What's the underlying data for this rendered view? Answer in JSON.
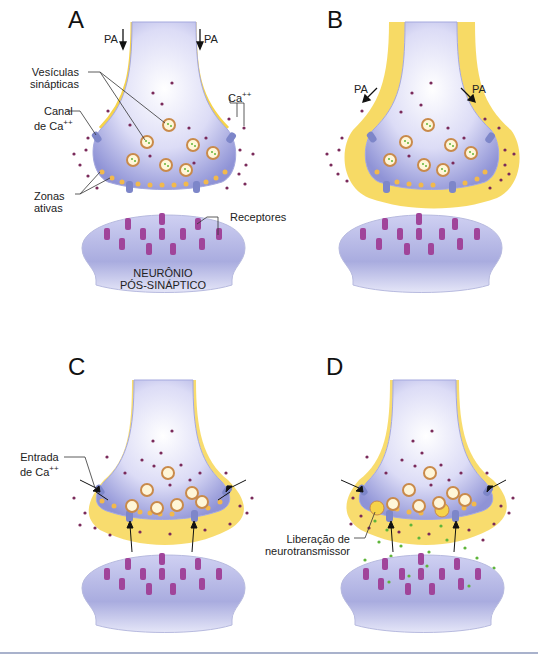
{
  "figure": {
    "panels": [
      {
        "id": "A",
        "letter": "A",
        "labels": {
          "pa_left": "PA",
          "pa_right": "PA",
          "vesicles": "Vesículas sinápticas",
          "vesicles_line1": "Vesículas",
          "vesicles_line2": "sinápticas",
          "ca_channel_line1": "Canal",
          "ca_channel_line2": "de Ca",
          "ca_channel_sup": "++",
          "ca_ion": "Ca",
          "ca_ion_sup": "++",
          "active_zones_line1": "Zonas",
          "active_zones_line2": "ativas",
          "receptors": "Receptores",
          "postsynaptic_line1": "NEURÔNIO",
          "postsynaptic_line2": "PÓS-SINÁPTICO"
        }
      },
      {
        "id": "B",
        "letter": "B",
        "labels": {
          "pa_left": "PA",
          "pa_right": "PA"
        }
      },
      {
        "id": "C",
        "letter": "C",
        "labels": {
          "ca_entry_line1": "Entrada",
          "ca_entry_line2": "de Ca",
          "ca_entry_sup": "++"
        }
      },
      {
        "id": "D",
        "letter": "D",
        "labels": {
          "release_line1": "Liberação de",
          "release_line2": "neurotransmissor"
        }
      }
    ],
    "colors": {
      "terminal_fill": "#c9cbef",
      "terminal_edge": "#8f93d6",
      "depolarization": "#f6d34a",
      "ion_dot": "#7a2a5a",
      "vesicle_ring": "#c98a4a",
      "vesicle_inner": "#fff6d8",
      "neurotransmitter": "#5fb53a",
      "receptor": "#a0459a",
      "channel": "#7d86c9",
      "active_zone": "#f2b94c",
      "rule": "#a9b2cc"
    }
  }
}
